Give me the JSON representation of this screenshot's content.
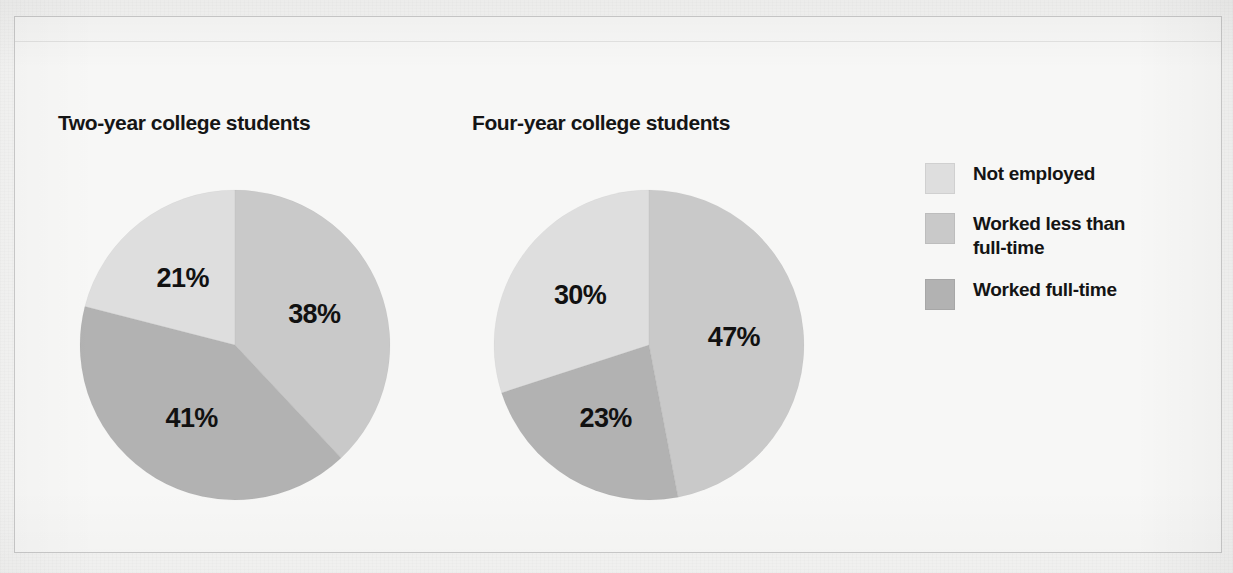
{
  "figure": {
    "background_color": "#f4f4f3",
    "frame_color": "#c9c9c9"
  },
  "legend": {
    "position": "right",
    "items": [
      {
        "label": "Not employed",
        "color": "#dedede"
      },
      {
        "label": "Worked less than\nfull-time",
        "label_line1": "Worked less than",
        "label_line2": "full-time",
        "color": "#c9c9c9"
      },
      {
        "label": "Worked full-time",
        "color": "#b2b2b2"
      }
    ]
  },
  "chart_data": [
    {
      "type": "pie",
      "title": "Two-year college students",
      "categories": [
        "Not employed",
        "Worked less than full-time",
        "Worked full-time"
      ],
      "values": [
        21,
        38,
        41
      ],
      "labels": [
        "21%",
        "38%",
        "41%"
      ],
      "colors": [
        "#dedede",
        "#c9c9c9",
        "#b2b2b2"
      ],
      "start_angle_deg": 0,
      "direction": "not-employed-counterclockwise"
    },
    {
      "type": "pie",
      "title": "Four-year college students",
      "categories": [
        "Not employed",
        "Worked less than full-time",
        "Worked full-time"
      ],
      "values": [
        30,
        47,
        23
      ],
      "labels": [
        "30%",
        "47%",
        "23%"
      ],
      "colors": [
        "#dedede",
        "#c9c9c9",
        "#b2b2b2"
      ],
      "start_angle_deg": 0,
      "direction": "not-employed-counterclockwise"
    }
  ]
}
